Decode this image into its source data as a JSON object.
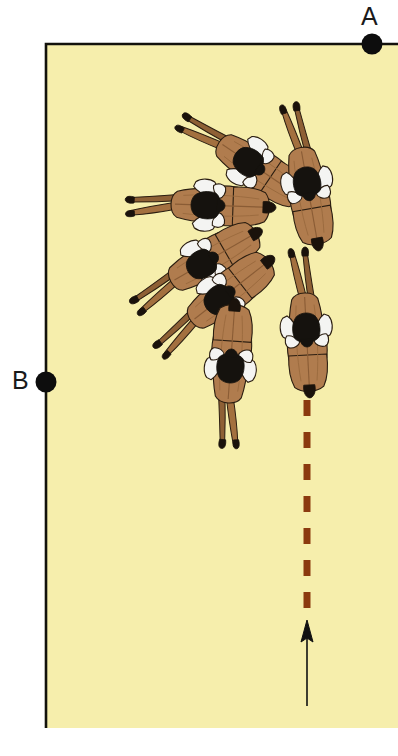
{
  "figure": {
    "type": "behavioral-trajectory-diagram",
    "width": 398,
    "height": 756
  },
  "labels": [
    {
      "id": "A",
      "text": "A",
      "x": 361,
      "y": 4,
      "marker_x": 372,
      "marker_y": 44
    },
    {
      "id": "B",
      "text": "B",
      "x": 12,
      "y": 368,
      "marker_x": 46,
      "marker_y": 382
    }
  ],
  "arena": {
    "fill": "#F6EEAC",
    "border_color": "#13120c",
    "left": 46,
    "top": 44,
    "right": 398,
    "bottom": 728,
    "border_width": 2.6,
    "note": "Black border drawn on top edge and left edge only"
  },
  "markers": {
    "color": "#0d0d0d",
    "radius": 10.5
  },
  "path": {
    "dashed_line": {
      "color": "#8B3A0F",
      "x": 307,
      "y_start": 400,
      "y_end": 608,
      "stroke_width": 7,
      "dash": "16 16"
    },
    "arrow": {
      "color": "#111111",
      "x": 307,
      "y_tail": 706,
      "y_head": 620,
      "stroke_width": 1.6,
      "head_width": 12,
      "head_length": 22
    }
  },
  "colors": {
    "body_brown": "#B07C4E",
    "body_brown_dark": "#97653C",
    "body_shadow": "#8A5C35",
    "tail_brown": "#A3703F",
    "marking_white": "#F4F4F2",
    "marking_dark": "#15120e",
    "outline": "#2a1d10",
    "tail_tip": "#1a120b"
  },
  "animals": [
    {
      "index": 1,
      "name": "animal-1",
      "cx": 244,
      "cy": 159,
      "rotation": -56,
      "scale": 1.0,
      "note": "top-left of arc, tail toward upper-left"
    },
    {
      "index": 2,
      "name": "animal-2",
      "cx": 306,
      "cy": 177,
      "rotation": -10,
      "scale": 1.0,
      "note": "top-right of arc, nearly upright"
    },
    {
      "index": 3,
      "name": "animal-3",
      "cx": 201,
      "cy": 205,
      "rotation": -88,
      "scale": 1.0,
      "note": "pointing right, tail to the left"
    },
    {
      "index": 4,
      "name": "animal-4",
      "cx": 197,
      "cy": 267,
      "rotation": -120,
      "scale": 1.0,
      "note": "tail to lower-left"
    },
    {
      "index": 5,
      "name": "animal-5",
      "cx": 215,
      "cy": 303,
      "rotation": -128,
      "scale": 1.0,
      "note": "tail to lower-left"
    },
    {
      "index": 6,
      "name": "animal-6",
      "cx": 306,
      "cy": 323,
      "rotation": -3,
      "scale": 1.0,
      "note": "upright, at start of dashed path"
    },
    {
      "index": 7,
      "name": "animal-7",
      "cx": 230,
      "cy": 373,
      "rotation": -176,
      "scale": 1.0,
      "note": "bottom of arc, head pointing down"
    }
  ]
}
